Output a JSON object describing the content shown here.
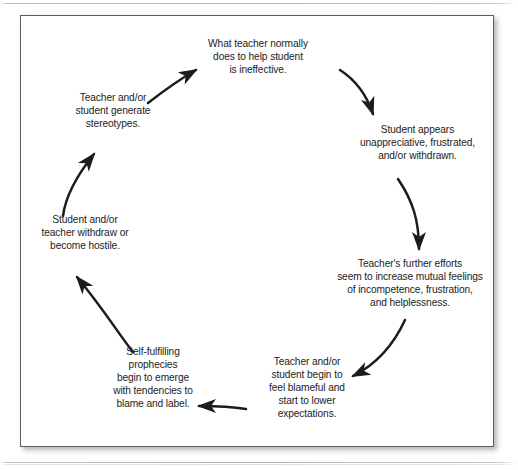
{
  "figure": {
    "type": "cycle-diagram",
    "node_count": 7,
    "arrow_count": 7,
    "direction": "clockwise",
    "border_color": "#5d5d5d",
    "text_color": "#1c1c1c",
    "background": "#ffffff",
    "nodes": [
      {
        "id": "ineffective",
        "position": "top",
        "lines": [
          "What teacher normally",
          "does to help student",
          "is ineffective."
        ]
      },
      {
        "id": "unappreciative",
        "position": "upper-right",
        "lines": [
          "Student appears",
          "unappreciative, frustrated,",
          "and/or withdrawn."
        ]
      },
      {
        "id": "efforts",
        "position": "lower-right",
        "lines": [
          "Teacher's further efforts",
          "seem to increase mutual feelings",
          "of incompetence, frustration,",
          "and helplessness."
        ]
      },
      {
        "id": "blameful",
        "position": "bottom-right",
        "lines": [
          "Teacher and/or",
          "student begin to",
          "feel blameful and",
          "start to lower",
          "expectations."
        ]
      },
      {
        "id": "prophecies",
        "position": "bottom-left",
        "lines": [
          "Self-fulfilling",
          "prophecies",
          "begin to emerge",
          "with tendencies to",
          "blame and label."
        ]
      },
      {
        "id": "hostile",
        "position": "left",
        "lines": [
          "Student and/or",
          "teacher withdraw or",
          "become hostile."
        ]
      },
      {
        "id": "stereotypes",
        "position": "upper-left",
        "lines": [
          "Teacher and/or",
          "student generate",
          "stereotypes."
        ]
      }
    ]
  }
}
